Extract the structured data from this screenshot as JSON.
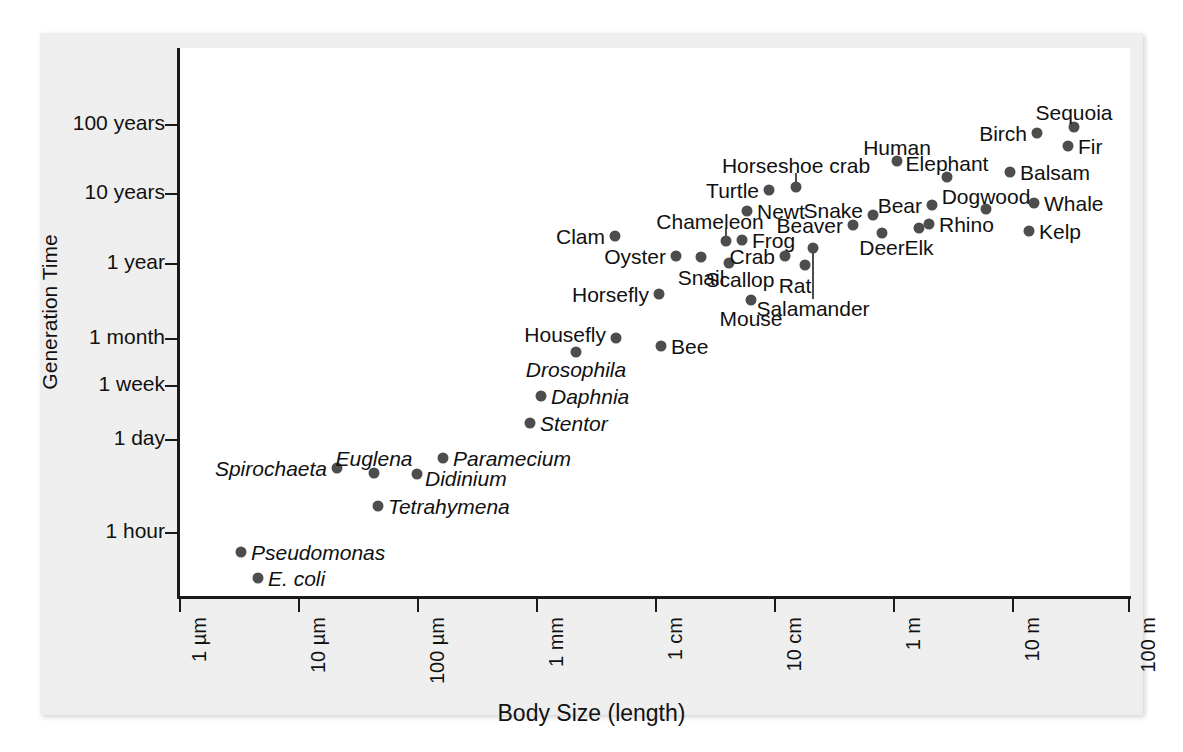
{
  "figure": {
    "x_axis_title": "Body Size (length)",
    "y_axis_title": "Generation Time"
  },
  "chart_data": {
    "type": "scatter",
    "title": "",
    "xlabel": "Body Size (length)",
    "ylabel": "Generation Time",
    "grid": false,
    "legend": "none",
    "x_scale": "log",
    "y_scale": "log",
    "x_tick_labels": [
      "1 µm",
      "10 µm",
      "100 µm",
      "1 mm",
      "1 cm",
      "10 cm",
      "1 m",
      "10 m",
      "100 m"
    ],
    "y_tick_labels": [
      "100 years",
      "10 years",
      "1 year",
      "1 month",
      "1 week",
      "1 day",
      "1 hour"
    ],
    "points": [
      {
        "label": "E. coli",
        "italic": true,
        "x": 258,
        "y": 578,
        "lx": 268,
        "ly": 578,
        "anchor": "start"
      },
      {
        "label": "Pseudomonas",
        "italic": true,
        "x": 241,
        "y": 552,
        "lx": 251,
        "ly": 552,
        "anchor": "start"
      },
      {
        "label": "Tetrahymena",
        "italic": true,
        "x": 378,
        "y": 506,
        "lx": 388,
        "ly": 506,
        "anchor": "start"
      },
      {
        "label": "Spirochaeta",
        "italic": true,
        "x": 337,
        "y": 468,
        "lx": 327,
        "ly": 468,
        "anchor": "end"
      },
      {
        "label": "Euglena",
        "italic": true,
        "x": 374,
        "y": 473,
        "lx": 374,
        "ly": 458,
        "anchor": "mid"
      },
      {
        "label": "Didinium",
        "italic": true,
        "x": 417,
        "y": 474,
        "lx": 425,
        "ly": 478,
        "anchor": "start"
      },
      {
        "label": "Paramecium",
        "italic": true,
        "x": 443,
        "y": 458,
        "lx": 453,
        "ly": 458,
        "anchor": "start"
      },
      {
        "label": "Stentor",
        "italic": true,
        "x": 530,
        "y": 423,
        "lx": 540,
        "ly": 423,
        "anchor": "start"
      },
      {
        "label": "Daphnia",
        "italic": true,
        "x": 541,
        "y": 396,
        "lx": 551,
        "ly": 396,
        "anchor": "start"
      },
      {
        "label": "Drosophila",
        "italic": true,
        "x": 576,
        "y": 352,
        "lx": 576,
        "ly": 369,
        "anchor": "mid"
      },
      {
        "label": "Housefly",
        "italic": false,
        "x": 616,
        "y": 338,
        "lx": 606,
        "ly": 334,
        "anchor": "end"
      },
      {
        "label": "Bee",
        "italic": false,
        "x": 661,
        "y": 346,
        "lx": 671,
        "ly": 346,
        "anchor": "start"
      },
      {
        "label": "Horsefly",
        "italic": false,
        "x": 659,
        "y": 294,
        "lx": 649,
        "ly": 294,
        "anchor": "end"
      },
      {
        "label": "Clam",
        "italic": false,
        "x": 615,
        "y": 236,
        "lx": 605,
        "ly": 236,
        "anchor": "end"
      },
      {
        "label": "Oyster",
        "italic": false,
        "x": 676,
        "y": 256,
        "lx": 666,
        "ly": 256,
        "anchor": "end"
      },
      {
        "label": "Snail",
        "italic": false,
        "x": 701,
        "y": 257,
        "lx": 701,
        "ly": 277,
        "anchor": "mid"
      },
      {
        "label": "Scallop",
        "italic": false,
        "x": 729,
        "y": 263,
        "lx": 740,
        "ly": 279,
        "anchor": "mid"
      },
      {
        "label": "Chameleon",
        "italic": false,
        "x": 726,
        "y": 241,
        "lx": 710,
        "ly": 221,
        "anchor": "mid"
      },
      {
        "label": "Frog",
        "italic": false,
        "x": 742,
        "y": 240,
        "lx": 752,
        "ly": 240,
        "anchor": "start"
      },
      {
        "label": "Crab",
        "italic": false,
        "x": 785,
        "y": 256,
        "lx": 775,
        "ly": 256,
        "anchor": "end"
      },
      {
        "label": "Rat",
        "italic": false,
        "x": 805,
        "y": 265,
        "lx": 795,
        "ly": 285,
        "anchor": "mid"
      },
      {
        "label": "Mouse",
        "italic": false,
        "x": 751,
        "y": 300,
        "lx": 751,
        "ly": 318,
        "anchor": "mid"
      },
      {
        "label": "Salamander",
        "italic": false,
        "x": 813,
        "y": 248,
        "lx": 813,
        "ly": 308,
        "anchor": "mid"
      },
      {
        "label": "Turtle",
        "italic": false,
        "x": 769,
        "y": 190,
        "lx": 759,
        "ly": 190,
        "anchor": "end"
      },
      {
        "label": "Newt",
        "italic": false,
        "x": 747,
        "y": 211,
        "lx": 757,
        "ly": 211,
        "anchor": "start"
      },
      {
        "label": "Horseshoe crab",
        "italic": false,
        "x": 796,
        "y": 187,
        "lx": 796,
        "ly": 165,
        "anchor": "mid"
      },
      {
        "label": "Beaver",
        "italic": false,
        "x": 853,
        "y": 225,
        "lx": 843,
        "ly": 225,
        "anchor": "end"
      },
      {
        "label": "Snake",
        "italic": false,
        "x": 873,
        "y": 215,
        "lx": 863,
        "ly": 210,
        "anchor": "end"
      },
      {
        "label": "Deer",
        "italic": false,
        "x": 882,
        "y": 233,
        "lx": 882,
        "ly": 247,
        "anchor": "mid"
      },
      {
        "label": "Elk",
        "italic": false,
        "x": 919,
        "y": 228,
        "lx": 919,
        "ly": 247,
        "anchor": "mid"
      },
      {
        "label": "Bear",
        "italic": false,
        "x": 932,
        "y": 205,
        "lx": 922,
        "ly": 205,
        "anchor": "end"
      },
      {
        "label": "Rhino",
        "italic": false,
        "x": 929,
        "y": 224,
        "lx": 939,
        "ly": 224,
        "anchor": "start"
      },
      {
        "label": "Human",
        "italic": false,
        "x": 897,
        "y": 161,
        "lx": 897,
        "ly": 147,
        "anchor": "mid"
      },
      {
        "label": "Elephant",
        "italic": false,
        "x": 947,
        "y": 177,
        "lx": 947,
        "ly": 163,
        "anchor": "mid"
      },
      {
        "label": "Dogwood",
        "italic": false,
        "x": 986,
        "y": 209,
        "lx": 986,
        "ly": 196,
        "anchor": "mid"
      },
      {
        "label": "Balsam",
        "italic": false,
        "x": 1010,
        "y": 172,
        "lx": 1020,
        "ly": 172,
        "anchor": "start"
      },
      {
        "label": "Whale",
        "italic": false,
        "x": 1034,
        "y": 203,
        "lx": 1044,
        "ly": 203,
        "anchor": "start"
      },
      {
        "label": "Kelp",
        "italic": false,
        "x": 1029,
        "y": 231,
        "lx": 1039,
        "ly": 231,
        "anchor": "start"
      },
      {
        "label": "Birch",
        "italic": false,
        "x": 1037,
        "y": 133,
        "lx": 1027,
        "ly": 133,
        "anchor": "end"
      },
      {
        "label": "Fir",
        "italic": false,
        "x": 1068,
        "y": 146,
        "lx": 1078,
        "ly": 146,
        "anchor": "start"
      },
      {
        "label": "Sequoia",
        "italic": false,
        "x": 1074,
        "y": 127,
        "lx": 1074,
        "ly": 112,
        "anchor": "mid"
      }
    ],
    "leader_lines": [
      {
        "name": "horseshoe-crab-leader",
        "x": 796,
        "y1": 173,
        "y2": 187
      },
      {
        "name": "chameleon-leader",
        "x": 726,
        "y1": 228,
        "y2": 241
      },
      {
        "name": "salamander-leader",
        "x": 813,
        "y1": 248,
        "y2": 299
      }
    ]
  },
  "axes": {
    "y_ticks": [
      {
        "label": "100 years",
        "top": 124
      },
      {
        "label": "10 years",
        "top": 193
      },
      {
        "label": "1 year",
        "top": 263
      },
      {
        "label": "1 month",
        "top": 338
      },
      {
        "label": "1 week",
        "top": 385
      },
      {
        "label": "1 day",
        "top": 439
      },
      {
        "label": "1 hour",
        "top": 532
      }
    ],
    "x_ticks": [
      {
        "label": "1 µm",
        "left": 179
      },
      {
        "label": "10 µm",
        "left": 298
      },
      {
        "label": "100 µm",
        "left": 417
      },
      {
        "label": "1 mm",
        "left": 536
      },
      {
        "label": "1 cm",
        "left": 655
      },
      {
        "label": "10 cm",
        "left": 774
      },
      {
        "label": "1 m",
        "left": 893
      },
      {
        "label": "10 m",
        "left": 1012
      },
      {
        "label": "100 m",
        "left": 1128
      }
    ]
  }
}
